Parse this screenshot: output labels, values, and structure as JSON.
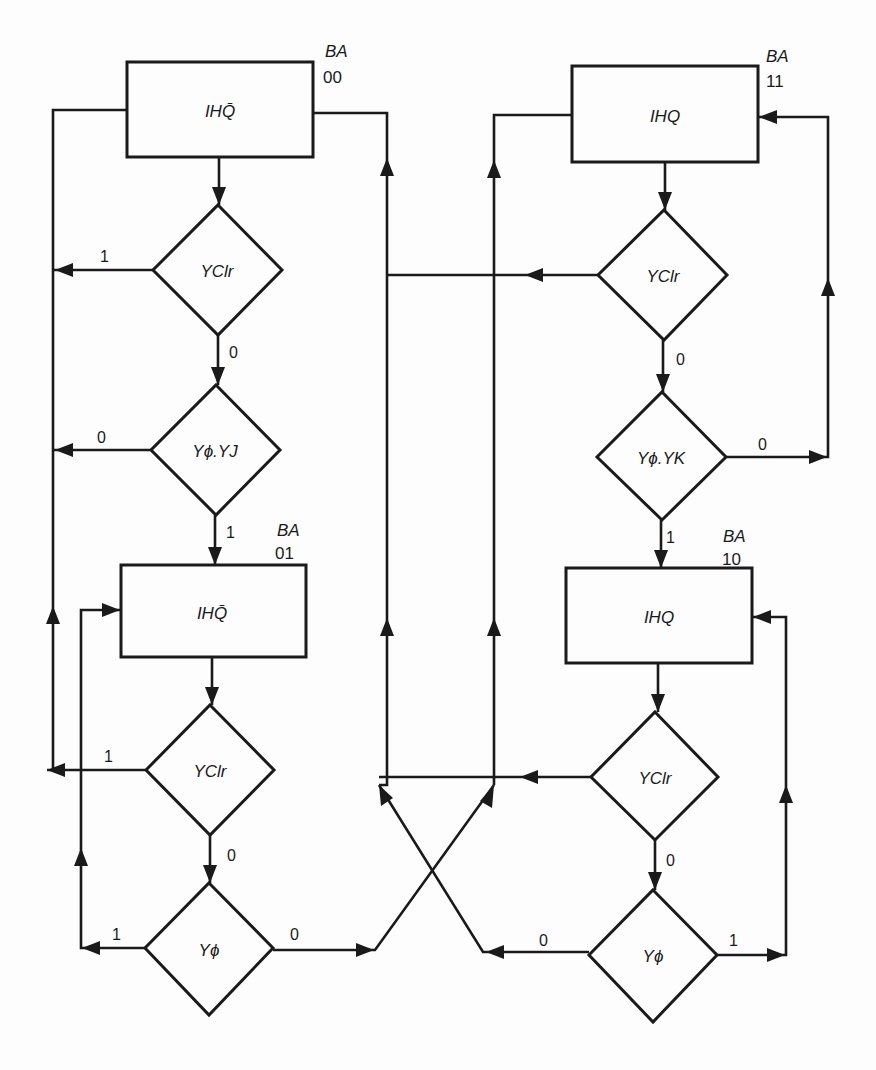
{
  "diagram": {
    "type": "ASM flowchart (JK flip-flop state machine)",
    "states": [
      {
        "id": "s00",
        "output": "IHQ̄",
        "ba_label": "BA",
        "code": "00"
      },
      {
        "id": "s01",
        "output": "IHQ̄",
        "ba_label": "BA",
        "code": "01"
      },
      {
        "id": "s11",
        "output": "IHQ",
        "ba_label": "BA",
        "code": "11"
      },
      {
        "id": "s10",
        "output": "IHQ",
        "ba_label": "BA",
        "code": "10"
      }
    ],
    "decisions": [
      {
        "id": "d00_clr",
        "condition": "YClr",
        "exit_left": "1",
        "exit_down": "0"
      },
      {
        "id": "d00_jk",
        "condition": "Yϕ.YJ",
        "exit_left": "0",
        "exit_down": "1"
      },
      {
        "id": "d01_clr",
        "condition": "YClr",
        "exit_left": "1",
        "exit_down": "0"
      },
      {
        "id": "d01_clk",
        "condition": "Yϕ",
        "exit_left": "1",
        "exit_right": "0"
      },
      {
        "id": "d11_clr",
        "condition": "YClr",
        "exit_left": "",
        "exit_down": "0"
      },
      {
        "id": "d11_jk",
        "condition": "Yϕ.YK",
        "exit_right": "0",
        "exit_down": "1"
      },
      {
        "id": "d10_clr",
        "condition": "YClr",
        "exit_left": "",
        "exit_down": "0"
      },
      {
        "id": "d10_clk",
        "condition": "Yϕ",
        "exit_left": "0",
        "exit_right": "1"
      }
    ]
  }
}
